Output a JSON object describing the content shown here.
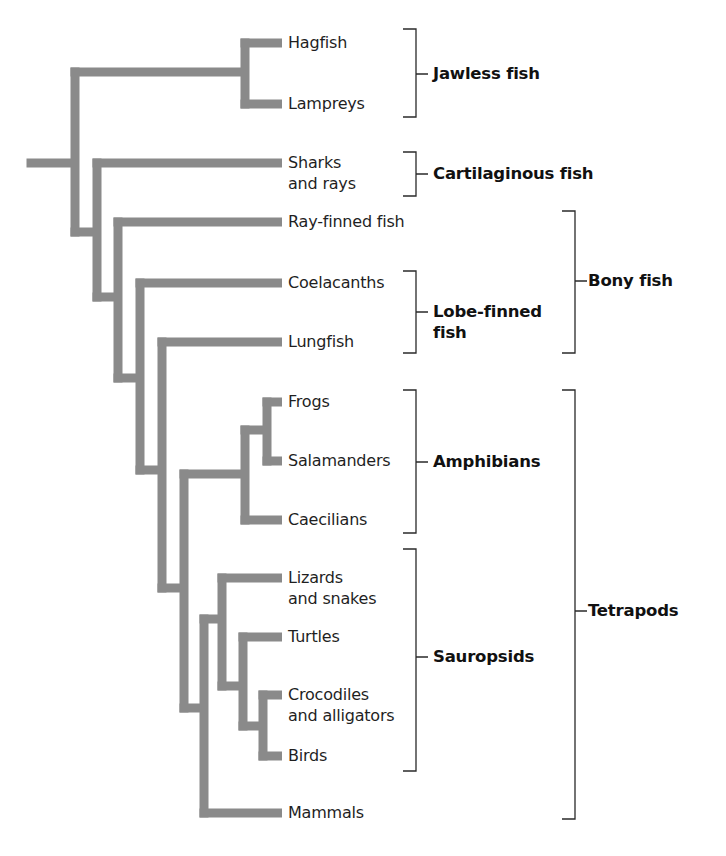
{
  "figure": {
    "branch_color": "#8a8a8a",
    "bracket_color": "#2a2a2a",
    "text_color": "#1f1f1f"
  },
  "leaves": [
    {
      "id": "hagfish",
      "lines": [
        "Hagfish"
      ],
      "y": 43
    },
    {
      "id": "lampreys",
      "lines": [
        "Lampreys"
      ],
      "y": 104
    },
    {
      "id": "sharks",
      "lines": [
        "Sharks",
        "and rays"
      ],
      "y": 163
    },
    {
      "id": "ray-finned",
      "lines": [
        "Ray-finned fish"
      ],
      "y": 222
    },
    {
      "id": "coelacanths",
      "lines": [
        "Coelacanths"
      ],
      "y": 283
    },
    {
      "id": "lungfish",
      "lines": [
        "Lungfish"
      ],
      "y": 342
    },
    {
      "id": "frogs",
      "lines": [
        "Frogs"
      ],
      "y": 402
    },
    {
      "id": "salamanders",
      "lines": [
        "Salamanders"
      ],
      "y": 461
    },
    {
      "id": "caecilians",
      "lines": [
        "Caecilians"
      ],
      "y": 520
    },
    {
      "id": "lizards",
      "lines": [
        "Lizards",
        "and snakes"
      ],
      "y": 578
    },
    {
      "id": "turtles",
      "lines": [
        "Turtles"
      ],
      "y": 637
    },
    {
      "id": "crocodiles",
      "lines": [
        "Crocodiles",
        "and alligators"
      ],
      "y": 695
    },
    {
      "id": "birds",
      "lines": [
        "Birds"
      ],
      "y": 756
    },
    {
      "id": "mammals",
      "lines": [
        "Mammals"
      ],
      "y": 813
    }
  ],
  "groups": [
    {
      "id": "jawless-fish",
      "lines": [
        "Jawless fish"
      ],
      "x": 403,
      "top": 29,
      "bottom": 117,
      "tick_y": 74,
      "label_x": 433
    },
    {
      "id": "cartilaginous-fish",
      "lines": [
        "Cartilaginous fish"
      ],
      "x": 403,
      "top": 152,
      "bottom": 196,
      "tick_y": 174,
      "label_x": 433
    },
    {
      "id": "lobe-finned-fish",
      "lines": [
        "Lobe-finned",
        "fish"
      ],
      "x": 403,
      "top": 271,
      "bottom": 353,
      "tick_y": 312,
      "label_x": 433
    },
    {
      "id": "amphibians",
      "lines": [
        "Amphibians"
      ],
      "x": 403,
      "top": 390,
      "bottom": 533,
      "tick_y": 462,
      "label_x": 433
    },
    {
      "id": "sauropsids",
      "lines": [
        "Sauropsids"
      ],
      "x": 403,
      "top": 549,
      "bottom": 771,
      "tick_y": 657,
      "label_x": 433
    },
    {
      "id": "bony-fish",
      "lines": [
        "Bony fish"
      ],
      "x": 562,
      "top": 211,
      "bottom": 353,
      "tick_y": 281,
      "label_x": 588
    },
    {
      "id": "tetrapods",
      "lines": [
        "Tetrapods"
      ],
      "x": 562,
      "top": 390,
      "bottom": 819,
      "tick_y": 611,
      "label_x": 588
    }
  ],
  "branches": {
    "thickness": 9,
    "leaf_end_x": 282,
    "segments": [
      {
        "h": [
          31,
          75,
          163
        ]
      },
      {
        "v": [
          75,
          72,
          232
        ]
      },
      {
        "h": [
          75,
          245,
          72
        ]
      },
      {
        "v": [
          245,
          43,
          104
        ]
      },
      {
        "h": [
          245,
          282,
          43
        ]
      },
      {
        "h": [
          245,
          282,
          104
        ]
      },
      {
        "h": [
          75,
          97,
          232
        ]
      },
      {
        "v": [
          97,
          163,
          297
        ]
      },
      {
        "h": [
          97,
          282,
          163
        ]
      },
      {
        "h": [
          97,
          118,
          297
        ]
      },
      {
        "v": [
          118,
          222,
          378
        ]
      },
      {
        "h": [
          118,
          282,
          222
        ]
      },
      {
        "h": [
          118,
          140,
          378
        ]
      },
      {
        "v": [
          140,
          283,
          470
        ]
      },
      {
        "h": [
          140,
          282,
          283
        ]
      },
      {
        "h": [
          140,
          162,
          470
        ]
      },
      {
        "v": [
          162,
          342,
          588
        ]
      },
      {
        "h": [
          162,
          282,
          342
        ]
      },
      {
        "h": [
          162,
          184,
          588
        ]
      },
      {
        "v": [
          184,
          474,
          708
        ]
      },
      {
        "h": [
          184,
          245,
          474
        ]
      },
      {
        "v": [
          245,
          430,
          520
        ]
      },
      {
        "h": [
          245,
          282,
          520
        ]
      },
      {
        "h": [
          245,
          267,
          430
        ]
      },
      {
        "v": [
          267,
          402,
          461
        ]
      },
      {
        "h": [
          267,
          282,
          402
        ]
      },
      {
        "h": [
          267,
          282,
          461
        ]
      },
      {
        "h": [
          184,
          204,
          708
        ]
      },
      {
        "v": [
          204,
          619,
          813
        ]
      },
      {
        "h": [
          204,
          282,
          813
        ]
      },
      {
        "h": [
          204,
          222,
          619
        ]
      },
      {
        "v": [
          222,
          578,
          686
        ]
      },
      {
        "h": [
          222,
          282,
          578
        ]
      },
      {
        "h": [
          222,
          243,
          686
        ]
      },
      {
        "v": [
          243,
          637,
          726
        ]
      },
      {
        "h": [
          243,
          282,
          637
        ]
      },
      {
        "h": [
          243,
          263,
          726
        ]
      },
      {
        "v": [
          263,
          695,
          756
        ]
      },
      {
        "h": [
          263,
          282,
          695
        ]
      },
      {
        "h": [
          263,
          282,
          756
        ]
      }
    ]
  },
  "chart_data": {
    "type": "tree",
    "title": "",
    "root": {
      "children": [
        {
          "children": [
            {
              "name": "Hagfish"
            },
            {
              "name": "Lampreys"
            }
          ]
        },
        {
          "children": [
            {
              "name": "Sharks and rays"
            },
            {
              "children": [
                {
                  "name": "Ray-finned fish"
                },
                {
                  "children": [
                    {
                      "name": "Coelacanths"
                    },
                    {
                      "children": [
                        {
                          "name": "Lungfish"
                        },
                        {
                          "children": [
                            {
                              "children": [
                                {
                                  "children": [
                                    {
                                      "name": "Frogs"
                                    },
                                    {
                                      "name": "Salamanders"
                                    }
                                  ]
                                },
                                {
                                  "name": "Caecilians"
                                }
                              ]
                            },
                            {
                              "children": [
                                {
                                  "children": [
                                    {
                                      "name": "Lizards and snakes"
                                    },
                                    {
                                      "children": [
                                        {
                                          "name": "Turtles"
                                        },
                                        {
                                          "children": [
                                            {
                                              "name": "Crocodiles and alligators"
                                            },
                                            {
                                              "name": "Birds"
                                            }
                                          ]
                                        }
                                      ]
                                    }
                                  ]
                                },
                                {
                                  "name": "Mammals"
                                }
                              ]
                            }
                          ]
                        }
                      ]
                    }
                  ]
                }
              ]
            }
          ]
        }
      ]
    },
    "groupings": [
      {
        "label": "Jawless fish",
        "members": [
          "Hagfish",
          "Lampreys"
        ]
      },
      {
        "label": "Cartilaginous fish",
        "members": [
          "Sharks and rays"
        ]
      },
      {
        "label": "Lobe-finned fish",
        "members": [
          "Coelacanths",
          "Lungfish"
        ]
      },
      {
        "label": "Bony fish",
        "members": [
          "Ray-finned fish",
          "Coelacanths",
          "Lungfish"
        ]
      },
      {
        "label": "Amphibians",
        "members": [
          "Frogs",
          "Salamanders",
          "Caecilians"
        ]
      },
      {
        "label": "Sauropsids",
        "members": [
          "Lizards and snakes",
          "Turtles",
          "Crocodiles and alligators",
          "Birds"
        ]
      },
      {
        "label": "Tetrapods",
        "members": [
          "Frogs",
          "Salamanders",
          "Caecilians",
          "Lizards and snakes",
          "Turtles",
          "Crocodiles and alligators",
          "Birds",
          "Mammals"
        ]
      }
    ]
  }
}
